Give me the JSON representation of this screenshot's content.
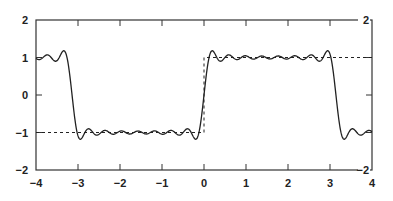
{
  "chart_data": {
    "type": "line",
    "title": "",
    "xlabel": "",
    "ylabel": "",
    "xlim": [
      -4,
      4
    ],
    "ylim": [
      -2,
      2
    ],
    "grid": false,
    "legend": null,
    "x_ticks": [
      "-4",
      "-3",
      "-2",
      "-1",
      "0",
      "1",
      "2",
      "3",
      "4"
    ],
    "y_ticks_left": [
      "2",
      "1",
      "0",
      "-1",
      "-2"
    ],
    "y_ticks_right": [
      "2",
      "-2"
    ],
    "series": [
      {
        "name": "square wave (ideal)",
        "style": "dashed",
        "color": "#222222",
        "points": [
          [
            -4,
            -1
          ],
          [
            0,
            -1
          ],
          [
            0,
            1
          ],
          [
            4,
            1
          ]
        ]
      },
      {
        "name": "Fourier partial sum approximation",
        "style": "solid",
        "color": "#222222",
        "description": "Gibbs oscillations around +/-1, transitions near x = -3.14, 0, 3.14",
        "points": [
          [
            -4,
            1.0
          ],
          [
            -3.6,
            1.05
          ],
          [
            -3.35,
            1.15
          ],
          [
            -3.14,
            0.0
          ],
          [
            -2.95,
            -1.15
          ],
          [
            -2.6,
            -0.95
          ],
          [
            -1.5,
            -1.0
          ],
          [
            -0.5,
            -1.0
          ],
          [
            -0.2,
            -1.15
          ],
          [
            0,
            0.0
          ],
          [
            0.2,
            1.15
          ],
          [
            0.5,
            1.0
          ],
          [
            1.5,
            1.0
          ],
          [
            2.6,
            0.95
          ],
          [
            2.95,
            1.15
          ],
          [
            3.14,
            0.0
          ],
          [
            3.35,
            -1.15
          ],
          [
            3.6,
            -1.05
          ],
          [
            4,
            -1.0
          ]
        ]
      }
    ]
  }
}
